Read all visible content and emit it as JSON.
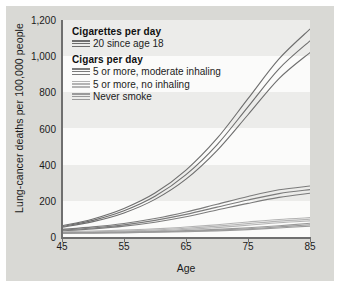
{
  "chart_data": {
    "type": "line",
    "title": "",
    "xlabel": "Age",
    "ylabel": "Lung-cancer deaths per 100,000 people",
    "xlim": [
      45,
      85
    ],
    "ylim": [
      0,
      1200
    ],
    "xticks": [
      "45",
      "55",
      "65",
      "75",
      "85"
    ],
    "xtick_values": [
      45,
      55,
      65,
      75,
      85
    ],
    "yticks": [
      "0",
      "200",
      "400",
      "600",
      "800",
      "1,000",
      "1,200"
    ],
    "ytick_values": [
      0,
      200,
      400,
      600,
      800,
      1000,
      1200
    ],
    "grid": "horizontal-bands",
    "legend_position": "inside-top-left",
    "x": [
      45,
      50,
      55,
      60,
      65,
      70,
      75,
      80,
      85
    ],
    "series": [
      {
        "name": "Cigarettes per day: 20 since age 18",
        "group": "Cigarettes per day",
        "label": "20 since age 18",
        "color": "#6e6e6e",
        "band": true,
        "values": [
          58,
          92,
          145,
          225,
          345,
          510,
          720,
          930,
          1085
        ],
        "upper": [
          62,
          100,
          158,
          243,
          370,
          545,
          765,
          985,
          1150
        ],
        "lower": [
          54,
          85,
          133,
          208,
          320,
          478,
          676,
          876,
          1020
        ]
      },
      {
        "name": "Cigars per day: 5 or more, moderate inhaling",
        "group": "Cigars per day",
        "label": "5 or more, moderate inhaling",
        "color": "#7b7b7b",
        "band": true,
        "values": [
          38,
          50,
          67,
          92,
          125,
          165,
          205,
          240,
          262
        ],
        "upper": [
          42,
          56,
          75,
          102,
          138,
          181,
          224,
          261,
          282
        ],
        "lower": [
          34,
          45,
          60,
          82,
          112,
          149,
          186,
          219,
          242
        ]
      },
      {
        "name": "Cigars per day: 5 or more, no inhaling",
        "group": "Cigars per day",
        "label": "5 or more, no inhaling",
        "color": "#b4b4b4",
        "band": true,
        "values": [
          26,
          29,
          33,
          39,
          48,
          60,
          74,
          88,
          98
        ],
        "upper": [
          29,
          33,
          38,
          45,
          55,
          68,
          83,
          97,
          107
        ],
        "lower": [
          23,
          26,
          29,
          34,
          42,
          52,
          65,
          79,
          89
        ]
      },
      {
        "name": "Never smoke",
        "group": "Cigars per day",
        "label": "Never smoke",
        "color": "#9a9a9a",
        "band": true,
        "values": [
          22,
          23,
          25,
          28,
          32,
          38,
          46,
          56,
          68
        ],
        "upper": [
          24,
          25,
          27,
          30,
          35,
          42,
          51,
          62,
          76
        ],
        "lower": [
          20,
          21,
          23,
          26,
          29,
          34,
          41,
          50,
          60
        ]
      }
    ],
    "legend": {
      "groups": [
        {
          "heading": "Cigarettes per day",
          "entries": [
            {
              "label": "20 since age 18",
              "color": "#6e6e6e"
            }
          ]
        },
        {
          "heading": "Cigars per day",
          "entries": [
            {
              "label": "5 or more, moderate inhaling",
              "color": "#7b7b7b"
            },
            {
              "label": "5 or more, no inhaling",
              "color": "#b4b4b4"
            },
            {
              "label": "Never smoke",
              "color": "#9a9a9a"
            }
          ]
        }
      ]
    },
    "colors": {
      "figure_background": "#d9d9d5",
      "plot_background": "#fbfbfa",
      "band": "#ececea",
      "axis": "#6f6f6f",
      "text": "#1b1b1b"
    }
  }
}
